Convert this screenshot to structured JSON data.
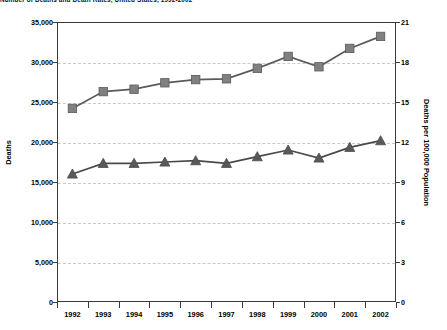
{
  "chart_data": {
    "type": "line",
    "title": "Number of Deaths and Death Rates, United States, 1992-2002",
    "categories": [
      "1992",
      "1993",
      "1994",
      "1995",
      "1996",
      "1997",
      "1998",
      "1999",
      "2000",
      "2001",
      "2002"
    ],
    "x": [
      1992,
      1993,
      1994,
      1995,
      1996,
      1997,
      1998,
      1999,
      2000,
      2001,
      2002
    ],
    "series": [
      {
        "name": "Deaths",
        "marker": "square",
        "color": "#808080",
        "line_color": "#5a5a5a",
        "axis": "left",
        "values": [
          24200,
          26300,
          26600,
          27400,
          27800,
          27900,
          29200,
          30700,
          29400,
          31700,
          33200
        ]
      },
      {
        "name": "Deaths per 100,000 Population",
        "marker": "triangle",
        "color": "#595959",
        "line_color": "#4a4a4a",
        "axis": "right",
        "values": [
          9.6,
          10.4,
          10.4,
          10.5,
          10.6,
          10.4,
          10.9,
          11.4,
          10.8,
          11.6,
          12.1
        ]
      }
    ],
    "left_axis": {
      "label": "Deaths",
      "ticks": [
        0,
        5000,
        10000,
        15000,
        20000,
        25000,
        30000,
        35000
      ],
      "tick_labels": [
        "0",
        "5,000",
        "10,000",
        "15,000",
        "20,000",
        "25,000",
        "30,000",
        "35,000"
      ],
      "min": 0,
      "max": 35000
    },
    "right_axis": {
      "label": "Deaths per 100,000 Population",
      "ticks": [
        0,
        3,
        6,
        9,
        12,
        15,
        18,
        21
      ],
      "tick_labels": [
        "0",
        "3",
        "6",
        "9",
        "12",
        "15",
        "18",
        "21"
      ],
      "min": 0,
      "max": 21
    },
    "xlabel": "",
    "grid": true,
    "grid_style": "dashed-horizontal",
    "legend": "none"
  }
}
